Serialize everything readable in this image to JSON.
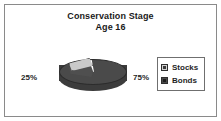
{
  "chart_data": {
    "type": "pie",
    "title": "Conservation Stage",
    "subtitle": "Age 16",
    "categories": [
      "Stocks",
      "Bonds"
    ],
    "values": [
      25,
      75
    ],
    "value_labels": [
      "25%",
      "75%"
    ],
    "colors": [
      "#c9c9c9",
      "#4a4a4a"
    ],
    "legend": {
      "position": "right",
      "entries": [
        {
          "label": "Stocks",
          "swatch": "light-square-icon",
          "color": "#c9c9c9"
        },
        {
          "label": "Bonds",
          "swatch": "dark-square-icon",
          "color": "#4a4a4a"
        }
      ]
    },
    "exploded_slice": "Stocks",
    "three_d": true,
    "grid": false,
    "xlabel": "",
    "ylabel": ""
  },
  "frame": {
    "border_color": "#8a8a8a",
    "background": "#ffffff"
  }
}
